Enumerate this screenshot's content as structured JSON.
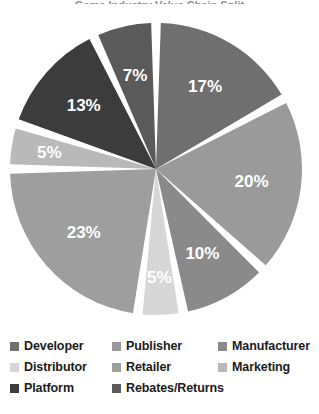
{
  "title_sliver": "Game Industry Value Chain Split",
  "chart_data": {
    "type": "pie",
    "title": "",
    "xlabel": "",
    "ylabel": "",
    "grid": false,
    "legend_position": "bottom",
    "start_angle_deg": 0,
    "direction": "clockwise",
    "categories": [
      "Developer",
      "Publisher",
      "Manufacturer",
      "Distributor",
      "Retailer",
      "Marketing",
      "Platform",
      "Rebates/Returns"
    ],
    "values": [
      17,
      20,
      10,
      5,
      23,
      5,
      13,
      7
    ],
    "value_labels": [
      "17%",
      "20%",
      "10%",
      "5%",
      "23%",
      "5%",
      "13%",
      "7%"
    ],
    "colors": [
      "#6f6f6f",
      "#9a9a9a",
      "#8a8a8a",
      "#d6d6d6",
      "#9e9e9e",
      "#b9b9b9",
      "#3c3c3c",
      "#5a5a5a"
    ],
    "slice_gap_color": "#ffffff",
    "label_color": "#ffffff"
  },
  "legend": {
    "rows": [
      [
        {
          "label": "Developer",
          "color": "#6f6f6f"
        },
        {
          "label": "Publisher",
          "color": "#9a9a9a"
        },
        {
          "label": "Manufacturer",
          "color": "#8a8a8a"
        }
      ],
      [
        {
          "label": "Distributor",
          "color": "#d6d6d6"
        },
        {
          "label": "Retailer",
          "color": "#9e9e9e"
        },
        {
          "label": "Marketing",
          "color": "#b9b9b9"
        }
      ],
      [
        {
          "label": "Platform",
          "color": "#3c3c3c"
        },
        {
          "label": "Rebates/Returns",
          "color": "#5a5a5a"
        }
      ]
    ]
  }
}
